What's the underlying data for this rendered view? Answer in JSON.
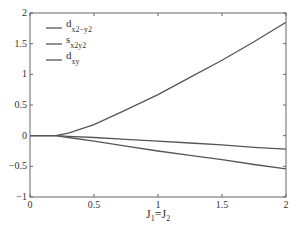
{
  "chart_data": {
    "type": "line",
    "title": "",
    "xlabel": "J1=J2",
    "ylabel": "",
    "xlim": [
      0,
      2
    ],
    "ylim": [
      -1,
      2
    ],
    "xticks": [
      "0",
      "0.5",
      "1",
      "1.5",
      "2"
    ],
    "yticks": [
      "2",
      "1.5",
      "1",
      "0.5",
      "0",
      "-0.5",
      "-1"
    ],
    "grid": false,
    "legend_position": "upper left",
    "x": [
      0,
      0.2,
      0.3,
      0.5,
      0.75,
      1.0,
      1.25,
      1.5,
      1.75,
      2.0
    ],
    "series": [
      {
        "name": "d_x2-y2",
        "label_main": "d",
        "label_sub": "x2−y2",
        "values": [
          0,
          0,
          0.04,
          0.18,
          0.42,
          0.67,
          0.95,
          1.23,
          1.53,
          1.85
        ]
      },
      {
        "name": "s_x2y2",
        "label_main": "s",
        "label_sub": "x2y2",
        "values": [
          0,
          0,
          -0.01,
          -0.03,
          -0.06,
          -0.09,
          -0.12,
          -0.15,
          -0.19,
          -0.22
        ]
      },
      {
        "name": "d_xy",
        "label_main": "d",
        "label_sub": "xy",
        "values": [
          0,
          0,
          -0.03,
          -0.09,
          -0.17,
          -0.25,
          -0.32,
          -0.39,
          -0.47,
          -0.54
        ]
      }
    ],
    "colors": {
      "line": "#555555",
      "axis": "#666666",
      "text": "#333333"
    }
  },
  "axis": {
    "xlabel_main_1": "J",
    "xlabel_sub_1": "1",
    "xlabel_eq": "=",
    "xlabel_main_2": "J",
    "xlabel_sub_2": "2"
  }
}
